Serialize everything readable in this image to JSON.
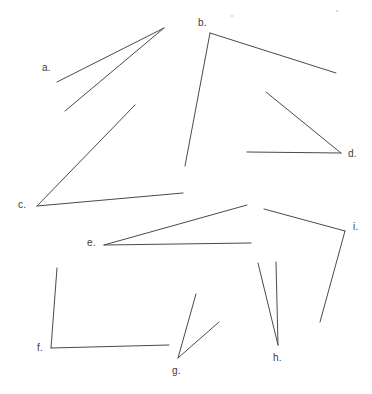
{
  "page": {
    "width": 372,
    "height": 394,
    "background_color": "#ffffff",
    "stroke_color": "#4a4a4a",
    "label_color": "#3b3b3b",
    "stroke_width": 1
  },
  "figure": {
    "kind": "line-drawing",
    "angles": [
      {
        "id": "a",
        "label": "a.",
        "label_x": 42,
        "label_y": 63,
        "vertex": {
          "x": 164,
          "y": 28
        },
        "rays": [
          {
            "x": 57,
            "y": 82
          },
          {
            "x": 65,
            "y": 111
          }
        ]
      },
      {
        "id": "b",
        "label": "b.",
        "label_x": 198,
        "label_y": 18,
        "vertex": {
          "x": 210,
          "y": 33
        },
        "rays": [
          {
            "x": 336,
            "y": 73
          },
          {
            "x": 185,
            "y": 166
          }
        ]
      },
      {
        "id": "c",
        "label": "c.",
        "label_x": 18,
        "label_y": 200,
        "vertex": {
          "x": 37,
          "y": 206
        },
        "rays": [
          {
            "x": 135,
            "y": 105
          },
          {
            "x": 183,
            "y": 193
          }
        ]
      },
      {
        "id": "d",
        "label": "d.",
        "label_x": 348,
        "label_y": 149,
        "vertex": {
          "x": 341,
          "y": 153
        },
        "rays": [
          {
            "x": 266,
            "y": 92
          },
          {
            "x": 247,
            "y": 152
          }
        ]
      },
      {
        "id": "e",
        "label": "e.",
        "label_x": 87,
        "label_y": 238,
        "vertex": {
          "x": 104,
          "y": 245
        },
        "rays": [
          {
            "x": 247,
            "y": 205
          },
          {
            "x": 251,
            "y": 243
          }
        ]
      },
      {
        "id": "f",
        "label": "f.",
        "label_x": 37,
        "label_y": 343,
        "vertex": {
          "x": 51,
          "y": 348
        },
        "rays": [
          {
            "x": 57,
            "y": 268
          },
          {
            "x": 169,
            "y": 345
          }
        ]
      },
      {
        "id": "g",
        "label": "g.",
        "label_x": 172,
        "label_y": 366,
        "vertex": {
          "x": 178,
          "y": 358
        },
        "rays": [
          {
            "x": 196,
            "y": 294
          },
          {
            "x": 219,
            "y": 322
          }
        ]
      },
      {
        "id": "h",
        "label": "h.",
        "label_x": 273,
        "label_y": 353,
        "vertex": {
          "x": 278,
          "y": 345
        },
        "rays": [
          {
            "x": 258,
            "y": 263
          },
          {
            "x": 276,
            "y": 262
          }
        ]
      },
      {
        "id": "i",
        "label": "i.",
        "label_x": 353,
        "label_y": 222,
        "vertex": {
          "x": 345,
          "y": 231
        },
        "rays": [
          {
            "x": 264,
            "y": 209
          },
          {
            "x": 320,
            "y": 322
          }
        ]
      }
    ],
    "specks": [
      {
        "x": 231,
        "y": 15
      },
      {
        "x": 336,
        "y": 10
      }
    ]
  }
}
